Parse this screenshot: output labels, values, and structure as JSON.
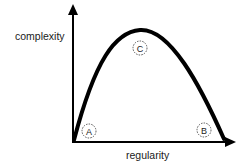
{
  "diagram": {
    "y_axis_label": "complexity",
    "x_axis_label": "regularity",
    "points": [
      {
        "id": "A",
        "label": "A"
      },
      {
        "id": "B",
        "label": "B"
      },
      {
        "id": "C",
        "label": "C"
      }
    ],
    "colors": {
      "stroke": "#000000",
      "background": "#ffffff",
      "marker": "#555555"
    }
  }
}
